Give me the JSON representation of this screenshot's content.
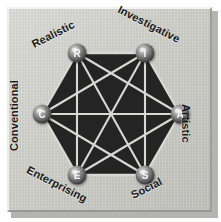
{
  "figure": {
    "background_color": "#ffffff",
    "plate_color": "#cfcfca",
    "hexagon_fill": "#242424",
    "edge_color": "#d8d8d4",
    "node_color": "#8e8e8e",
    "label_color": "#1a1a1a"
  },
  "chart_data": {
    "type": "diagram",
    "shape": "hexagon",
    "orientation": "flat-top",
    "node_count": 6,
    "nodes": [
      {
        "code": "R",
        "label": "Realistic",
        "angle_deg": -120,
        "x": 70,
        "y": 46,
        "label_rotation": -27
      },
      {
        "code": "I",
        "label": "Investigative",
        "angle_deg": -60,
        "x": 138,
        "y": 46,
        "label_rotation": 27
      },
      {
        "code": "A",
        "label": "Artistic",
        "angle_deg": 0,
        "x": 173,
        "y": 107,
        "label_rotation": 90
      },
      {
        "code": "S",
        "label": "Social",
        "angle_deg": 60,
        "x": 138,
        "y": 168,
        "label_rotation": -27
      },
      {
        "code": "E",
        "label": "Enterprising",
        "angle_deg": 120,
        "x": 70,
        "y": 168,
        "label_rotation": 27
      },
      {
        "code": "C",
        "label": "Conventional",
        "angle_deg": 180,
        "x": 35,
        "y": 107,
        "label_rotation": -90
      }
    ],
    "edges": [
      [
        "R",
        "I"
      ],
      [
        "I",
        "A"
      ],
      [
        "A",
        "S"
      ],
      [
        "S",
        "E"
      ],
      [
        "E",
        "C"
      ],
      [
        "C",
        "R"
      ],
      [
        "R",
        "A"
      ],
      [
        "R",
        "S"
      ],
      [
        "R",
        "E"
      ],
      [
        "I",
        "S"
      ],
      [
        "I",
        "E"
      ],
      [
        "I",
        "C"
      ],
      [
        "A",
        "E"
      ],
      [
        "A",
        "C"
      ],
      [
        "S",
        "C"
      ]
    ],
    "edge_count": 15,
    "graph_type": "complete graph K6",
    "legend": [],
    "annotations": []
  },
  "labels": {
    "realistic": "Realistic",
    "investigative": "Investigative",
    "artistic": "Artistic",
    "social": "Social",
    "enterprising": "Enterprising",
    "conventional": "Conventional"
  },
  "node_letters": {
    "r": "R",
    "i": "I",
    "a": "A",
    "s": "S",
    "e": "E",
    "c": "C"
  }
}
